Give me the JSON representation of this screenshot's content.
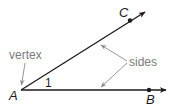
{
  "diagram": {
    "colors": {
      "ray": "#1a1a1a",
      "annotation": "#8a8a8a",
      "background": "#ffffff"
    },
    "points": {
      "A": {
        "label": "A",
        "x": 21,
        "y": 90
      },
      "B": {
        "label": "B",
        "x": 149,
        "y": 90
      },
      "C": {
        "label": "C",
        "x": 130,
        "y": 20
      }
    },
    "rays": [
      {
        "name": "ray-AB",
        "from": "A",
        "through": "B"
      },
      {
        "name": "ray-AC",
        "from": "A",
        "through": "C"
      }
    ],
    "angle_label": "1",
    "annotations": {
      "vertex": "vertex",
      "sides": "sides"
    }
  }
}
